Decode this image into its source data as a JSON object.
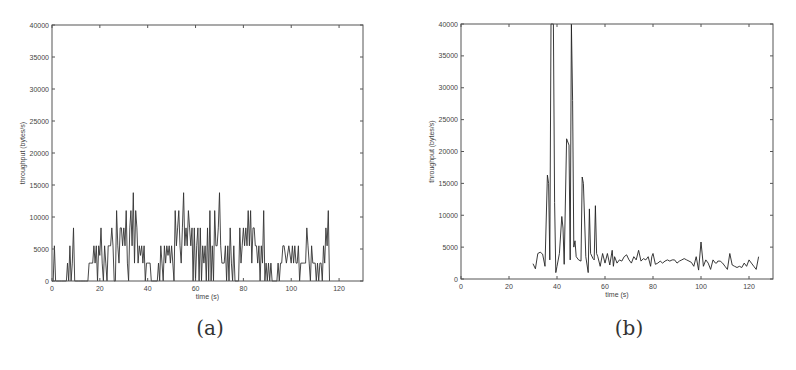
{
  "figure": {
    "captions": [
      "(a)",
      "(b)"
    ]
  },
  "chart_data": [
    {
      "type": "line",
      "panel": "(a)",
      "title": "",
      "xlabel": "time (s)",
      "ylabel": "throughput (bytes/s)",
      "xlim": [
        0,
        130
      ],
      "ylim": [
        0,
        40000
      ],
      "xticks": [
        0,
        20,
        40,
        60,
        80,
        100,
        120
      ],
      "yticks": [
        0,
        5000,
        10000,
        15000,
        20000,
        25000,
        30000,
        35000,
        40000
      ],
      "grid": false,
      "legend": null,
      "x": [
        0,
        0.5,
        1,
        1.5,
        2,
        2.5,
        3,
        4,
        5,
        6,
        6.5,
        7,
        7.5,
        8,
        8.5,
        9,
        9.5,
        10,
        11,
        12,
        13,
        14,
        15,
        15.5,
        16,
        17,
        17.5,
        18,
        18.5,
        19,
        19.5,
        20,
        20.5,
        21,
        21.5,
        22,
        22.5,
        23,
        23.5,
        24,
        24.5,
        25,
        25.5,
        26,
        26.5,
        27,
        27.5,
        28,
        28.5,
        29,
        29.5,
        30,
        30.5,
        31,
        31.5,
        32,
        32.5,
        33,
        33.5,
        34,
        34.5,
        35,
        35.5,
        36,
        36.5,
        37,
        37.5,
        38,
        38.5,
        39,
        39.5,
        40,
        40.5,
        41,
        41.5,
        42,
        43,
        44,
        44.5,
        45,
        45.5,
        46,
        46.5,
        47,
        47.5,
        48,
        48.5,
        49,
        49.5,
        50,
        50.5,
        51,
        51.5,
        52,
        52.5,
        53,
        53.5,
        54,
        54.5,
        55,
        55.5,
        56,
        56.5,
        57,
        57.5,
        58,
        58.5,
        59,
        59.5,
        60,
        60.5,
        61,
        61.5,
        62,
        62.5,
        63,
        63.5,
        64,
        64.5,
        65,
        65.5,
        66,
        66.5,
        67,
        67.5,
        68,
        68.5,
        69,
        69.5,
        70,
        70.5,
        71,
        71.5,
        72,
        72.5,
        73,
        73.5,
        74,
        74.5,
        75,
        75.5,
        76,
        76.5,
        77,
        77.5,
        78,
        78.5,
        79,
        79.5,
        80,
        80.5,
        81,
        81.5,
        82,
        82.5,
        83,
        83.5,
        84,
        84.5,
        85,
        85.5,
        86,
        86.5,
        87,
        87.5,
        88,
        88.5,
        89,
        89.5,
        90,
        90.5,
        91,
        91.5,
        92,
        92.5,
        93,
        93.5,
        94,
        94.5,
        95,
        95.5,
        96,
        96.5,
        97,
        98,
        99,
        100,
        100.5,
        101,
        101.5,
        102,
        102.5,
        103,
        103.5,
        104,
        104.5,
        105,
        105.5,
        106,
        106.5,
        107,
        107.5,
        108,
        108.5,
        109,
        109.5,
        110,
        110.5,
        111,
        111.5,
        112,
        112.5,
        113,
        113.5,
        114,
        114.5,
        115,
        115.5,
        116,
        116.5,
        117,
        117.5,
        118,
        118.5,
        119,
        119.5,
        120,
        120.5,
        121,
        121.5,
        122,
        122.5,
        123,
        123.5,
        124,
        124.5,
        125
      ],
      "values": [
        0,
        0,
        5500,
        0,
        0,
        0,
        0,
        0,
        0,
        0,
        2800,
        0,
        5500,
        0,
        2800,
        8300,
        0,
        0,
        0,
        0,
        0,
        0,
        0,
        2800,
        2800,
        2800,
        5500,
        2800,
        5500,
        0,
        5500,
        4000,
        8300,
        2800,
        0,
        5500,
        2800,
        0,
        5500,
        5500,
        5500,
        8300,
        5500,
        0,
        0,
        11000,
        5500,
        2800,
        8300,
        8300,
        5500,
        8300,
        5500,
        11000,
        2800,
        0,
        8300,
        11000,
        5500,
        13800,
        2800,
        11000,
        8300,
        2800,
        5500,
        4000,
        5500,
        2800,
        5500,
        0,
        2800,
        2800,
        2800,
        2800,
        0,
        0,
        0,
        0,
        2800,
        0,
        5500,
        2800,
        0,
        5500,
        2800,
        5500,
        4000,
        5500,
        2800,
        5500,
        2800,
        0,
        11000,
        5500,
        8300,
        11000,
        5500,
        2800,
        8300,
        13800,
        5500,
        8300,
        5500,
        11000,
        8300,
        5500,
        8300,
        0,
        8300,
        0,
        5500,
        8300,
        0,
        8300,
        0,
        5500,
        2800,
        5500,
        0,
        8300,
        0,
        11000,
        0,
        5500,
        0,
        11000,
        5500,
        5500,
        8300,
        13800,
        5500,
        2800,
        2800,
        2800,
        5500,
        0,
        5500,
        0,
        8300,
        2800,
        0,
        5500,
        0,
        0,
        0,
        0,
        8300,
        2800,
        5500,
        8300,
        5500,
        8300,
        5500,
        11000,
        5500,
        11000,
        2800,
        8300,
        8300,
        5500,
        5500,
        2800,
        5500,
        0,
        5500,
        2800,
        11000,
        0,
        2800,
        0,
        2800,
        0,
        2800,
        0,
        0,
        0,
        0,
        0,
        2800,
        0,
        2800,
        2800,
        5500,
        5500,
        2800,
        5500,
        2800,
        5500,
        2800,
        5500,
        2800,
        2800,
        5500,
        0,
        2800,
        2800,
        2800,
        2800,
        2800,
        8300,
        5500,
        2800,
        0,
        5500,
        2800,
        2800,
        2800,
        0,
        2800,
        0,
        2800,
        2800,
        0,
        5500,
        2800,
        8300,
        5500,
        11000,
        0
      ],
      "line_color": "#333333"
    },
    {
      "type": "line",
      "panel": "(b)",
      "title": "",
      "xlabel": "time (s)",
      "ylabel": "throughput (bytes/s)",
      "xlim": [
        0,
        130
      ],
      "ylim": [
        0,
        40000
      ],
      "xticks": [
        0,
        20,
        40,
        60,
        80,
        100,
        120
      ],
      "yticks": [
        0,
        5000,
        10000,
        15000,
        20000,
        25000,
        30000,
        35000,
        40000
      ],
      "grid": false,
      "legend": null,
      "x": [
        30,
        31,
        32,
        33,
        34,
        35,
        36,
        36.5,
        37,
        37.5,
        38,
        38.5,
        39,
        39.5,
        40,
        41,
        42,
        42.5,
        43,
        44,
        45,
        45.5,
        46,
        46.5,
        47,
        47.5,
        48,
        49,
        50,
        50.5,
        51,
        52,
        53,
        53.5,
        54,
        55,
        55.5,
        56,
        56.5,
        57,
        58,
        59,
        60,
        61,
        62,
        63,
        63.5,
        64,
        65,
        66,
        67,
        68,
        69,
        70,
        71,
        72,
        73,
        74,
        75,
        76,
        77,
        78,
        79,
        79.5,
        80,
        81,
        82,
        83,
        84,
        85,
        86,
        87,
        88,
        89,
        90,
        91,
        92,
        93,
        94,
        95,
        96,
        97,
        98,
        99,
        100,
        101,
        102,
        103,
        104,
        105,
        106,
        106.5,
        107,
        108,
        109,
        110,
        111,
        112,
        113,
        114,
        115,
        116,
        117,
        118,
        119,
        120,
        121,
        122,
        123,
        124,
        125,
        126,
        127,
        128,
        129,
        130
      ],
      "values": [
        2400,
        1600,
        4000,
        4200,
        3900,
        2000,
        16300,
        15000,
        3000,
        40000,
        40000,
        40000,
        12000,
        1000,
        2000,
        4000,
        9800,
        8000,
        2300,
        22000,
        21000,
        3000,
        40000,
        28000,
        5000,
        6000,
        3500,
        3000,
        2800,
        16000,
        15000,
        3500,
        1000,
        11000,
        4000,
        3200,
        3000,
        11500,
        4000,
        3500,
        2000,
        4000,
        2500,
        4000,
        2200,
        4500,
        2000,
        3500,
        2500,
        3000,
        2800,
        3500,
        3800,
        3000,
        2500,
        3500,
        3000,
        4500,
        2800,
        3200,
        3000,
        3500,
        2000,
        3500,
        4000,
        2300,
        2500,
        2800,
        2500,
        2800,
        3000,
        2800,
        3000,
        3000,
        2500,
        2800,
        3000,
        3200,
        3000,
        2800,
        2600,
        2000,
        3500,
        1400,
        5800,
        2000,
        3000,
        2500,
        1500,
        3000,
        2500,
        2500,
        2800,
        2800,
        2500,
        2000,
        1500,
        4000,
        2200,
        2000,
        1800,
        2000,
        1800,
        2500,
        2000,
        3000,
        2500,
        2000,
        1500,
        3500
      ],
      "line_color": "#222222"
    }
  ]
}
